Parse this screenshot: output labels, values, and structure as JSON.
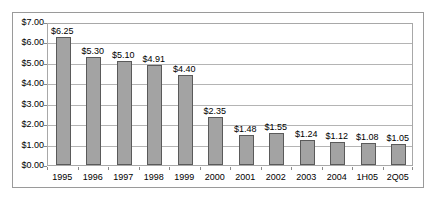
{
  "chart_data": {
    "type": "bar",
    "title": "",
    "subtitle": "",
    "xlabel": "",
    "ylabel": "",
    "categories": [
      "1995",
      "1996",
      "1997",
      "1998",
      "1999",
      "2000",
      "2001",
      "2002",
      "2003",
      "2004",
      "1H05",
      "2Q05"
    ],
    "values": [
      6.25,
      5.3,
      5.1,
      4.91,
      4.4,
      2.35,
      1.48,
      1.55,
      1.24,
      1.12,
      1.08,
      1.05
    ],
    "data_labels": [
      "$6.25",
      "$5.30",
      "$5.10",
      "$4.91",
      "$4.40",
      "$2.35",
      "$1.48",
      "$1.55",
      "$1.24",
      "$1.12",
      "$1.08",
      "$1.05"
    ],
    "ylim": [
      0,
      7
    ],
    "ytick_values": [
      0,
      1,
      2,
      3,
      4,
      5,
      6,
      7
    ],
    "ytick_labels": [
      "$0.00",
      "$1.00",
      "$2.00",
      "$3.00",
      "$4.00",
      "$5.00",
      "$6.00",
      "$7.00"
    ],
    "grid": true,
    "grid_axis": "y",
    "legend": false,
    "legend_position": "none",
    "series": [
      {
        "name": "",
        "values": [
          6.25,
          5.3,
          5.1,
          4.91,
          4.4,
          2.35,
          1.48,
          1.55,
          1.24,
          1.12,
          1.08,
          1.05
        ]
      }
    ],
    "colors": {
      "bar_fill": "#a3a3a3",
      "bar_border": "#5a5a5a",
      "gridline": "#b4b4b4",
      "plot_border": "#a8a8a8",
      "frame_border": "#9a9a9a",
      "background": "#ffffff",
      "text": "#000000"
    }
  }
}
